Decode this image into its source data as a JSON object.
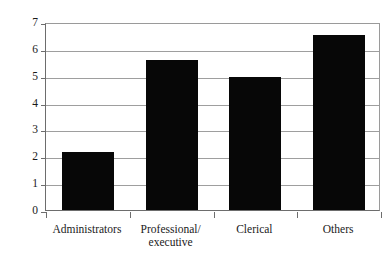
{
  "figure": {
    "scan_artifact_text": "",
    "background_color": "#ffffff",
    "bar_color": "#070707",
    "gridline_color": "#9e9e9e",
    "axis_color": "#6d6d6d"
  },
  "chart_data": {
    "type": "bar",
    "title": "",
    "xlabel": "",
    "ylabel": "10-year mortality (%)",
    "categories": [
      "Administrators",
      "Professional/\nexecutive",
      "Clerical",
      "Others"
    ],
    "values": [
      2.15,
      5.6,
      4.95,
      6.5
    ],
    "ylim": [
      0,
      7
    ],
    "ytick_labels": [
      "7",
      "6",
      "5",
      "4",
      "3",
      "2",
      "1",
      "0"
    ],
    "ytick_values": [
      7,
      6,
      5,
      4,
      3,
      2,
      1,
      0
    ],
    "grid": true,
    "legend": "none",
    "orientation": "vertical"
  }
}
